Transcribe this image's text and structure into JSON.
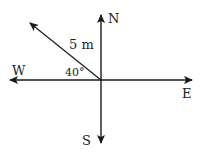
{
  "diagram": {
    "type": "compass-vector",
    "directions": {
      "north": "N",
      "south": "S",
      "east": "E",
      "west": "W"
    },
    "vector": {
      "magnitude_label": "5 m",
      "angle_label": "40°",
      "reference_axis": "W",
      "direction": "north of west"
    },
    "colors": {
      "line": "#1a1a1a",
      "background": "#ffffff"
    }
  }
}
